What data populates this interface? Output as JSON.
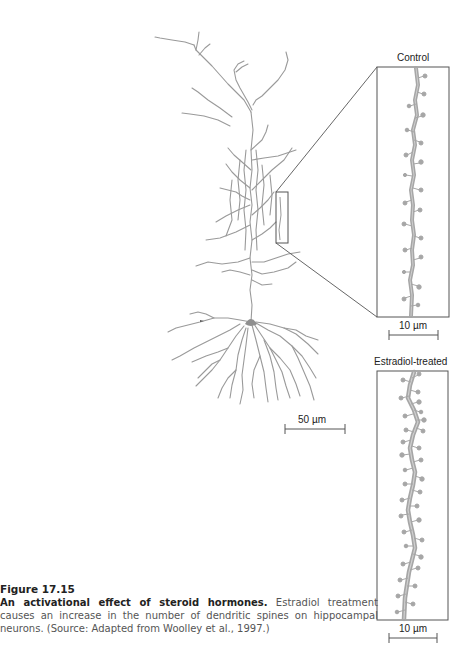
{
  "figure": {
    "number": "Figure 17.15",
    "title": "An activational effect of steroid hormones.",
    "body": " Estradiol treatment causes an increase in the number of dendritic spines on hippocampal neurons. (Source: Adapted from Woolley et al., 1997.)"
  },
  "panels": {
    "neuron": {
      "scale_bar": "50 µm"
    },
    "control": {
      "label": "Control",
      "scale_bar": "10 µm"
    },
    "estradiol": {
      "label": "Estradiol-treated",
      "scale_bar": "10 µm"
    }
  },
  "colors": {
    "dendrite": "#9a9a9a",
    "spine": "#a6a6a6",
    "frame": "#555555",
    "text": "#222222"
  }
}
